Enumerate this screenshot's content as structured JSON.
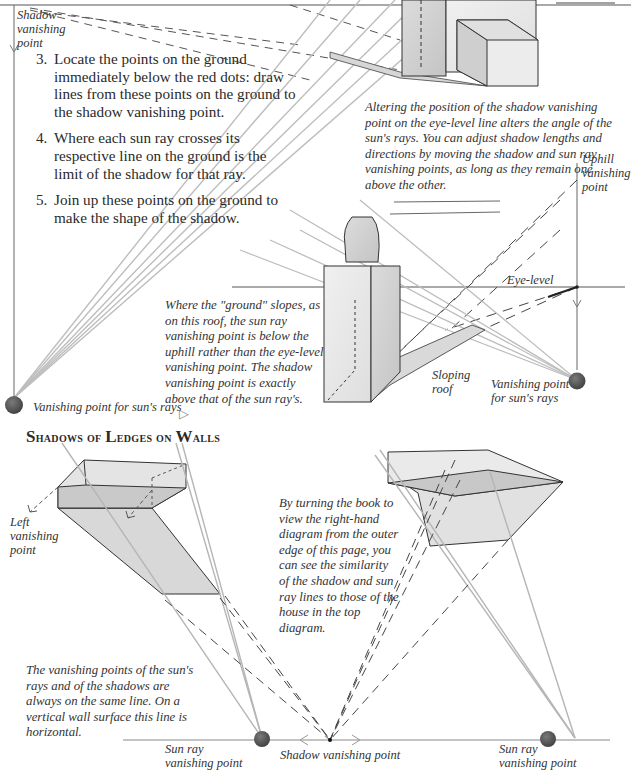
{
  "top_diagram": {
    "eye_level_label": "Eye-level",
    "shadow_vp_label": "Shadow vanishing point",
    "steps": [
      {
        "num": "3.",
        "text": "Locate the points on the ground immediately below the red dots: draw lines from these points on the ground to the shadow vanishing point."
      },
      {
        "num": "4.",
        "text": "Where each sun ray crosses its respective line on the ground is the limit of the shadow for that ray."
      },
      {
        "num": "5.",
        "text": "Join up these points on the ground to make the shape of the shadow."
      }
    ],
    "caption": "Altering the position of the shadow vanishing point on the eye-level line alters the angle of the sun's rays. You can adjust shadow lengths and directions by moving the shadow and sun ray vanishing points, as long as they remain one above the other.",
    "sun_vp_label": "Vanishing point for sun's rays"
  },
  "roof_diagram": {
    "uphill_vp_label": "Uphill vanishing point",
    "eye_level_label": "Eye-level",
    "caption": "Where the \"ground\" slopes, as on this roof, the sun ray vanishing point is below the uphill rather than the eye-level vanishing point. The shadow vanishing point is exactly above that of the sun ray's.",
    "caption_marker": "▷",
    "sloping_roof_label": "Sloping roof",
    "sun_vp_label": "Vanishing point for sun's rays"
  },
  "ledges_section": {
    "heading_first_letters": [
      "S",
      "L",
      "W"
    ],
    "heading": "Shadows of Ledges on Walls",
    "heading_parts": {
      "w1_cap": "S",
      "w1_rest": "hadows of ",
      "w2_cap": "L",
      "w2_rest": "edges on ",
      "w3_cap": "W",
      "w3_rest": "alls"
    },
    "left_vp_label": "Left vanishing point",
    "right_caption": "By turning the book to view the right-hand diagram from the outer edge of this page, you can see the similarity of the shadow and sun ray lines to those of the house in the top diagram.",
    "bottom_caption": "The vanishing points of the sun's rays and of the shadows are always on the same line. On a vertical wall surface this line is horizontal.",
    "sun_vp_left_label": "Sun ray vanishing point",
    "shadow_vp_label": "Shadow vanishing point",
    "sun_vp_right_label": "Sun ray vanishing point"
  },
  "colors": {
    "ink": "#2a2a2a",
    "ray_gray": "#b8b8b8",
    "shadow_fill": "#d9d9d9",
    "vp_dot": "#555555"
  }
}
